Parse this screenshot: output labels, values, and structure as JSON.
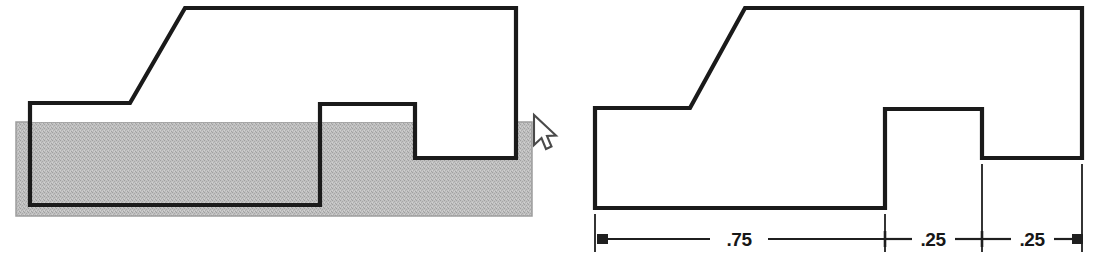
{
  "canvas": {
    "width": 1097,
    "height": 267,
    "background": "#ffffff"
  },
  "colors": {
    "outline": "#1a1a1a",
    "fill_gray": "#b9b9b9",
    "fill_gray_edge": "#9d9d9d",
    "white": "#ffffff",
    "dimension_line": "#1f1f1f",
    "cursor_fill": "#ffffff",
    "cursor_stroke": "#4a4a4a"
  },
  "figures": [
    {
      "name": "left-figure-with-stock-overlay",
      "description": "Profile outline overlaid on shaded rectangular stock bar",
      "stock_rect": {
        "x": 16,
        "y": 122,
        "width": 516,
        "height": 94
      },
      "outline_points": "30,103 184,103 184,103 30,103",
      "profile_path": "M30,103 L30,205 L320,205 L320,104 L415,104 L415,158 L516,158 L516,8 L185,8 L130,103 Z",
      "cursor": {
        "x": 533,
        "y": 115
      }
    },
    {
      "name": "right-figure-dimensioned",
      "description": "Same profile outline, unshaded, with horizontal dimension chain below",
      "profile_path": "M595,108 L595,208 L885,208 L885,109 L982,109 L982,158 L1082,158 L1082,8 L745,8 L690,108 Z"
    }
  ],
  "dimensions": {
    "line_y": 239,
    "extension_lines": [
      {
        "name": "ext-left",
        "x": 595,
        "y1": 214,
        "y2": 252
      },
      {
        "name": "ext-mid-1",
        "x": 885,
        "y1": 214,
        "y2": 252
      },
      {
        "name": "ext-mid-2",
        "x": 982,
        "y1": 164,
        "y2": 252
      },
      {
        "name": "ext-right",
        "x": 1082,
        "y1": 164,
        "y2": 252
      }
    ],
    "segments": [
      {
        "name": "dimension-segment-1",
        "label": ".75",
        "x_start": 595,
        "x_end": 885,
        "text_x": 739,
        "arrow_start": "filled",
        "arrow_end": "tick"
      },
      {
        "name": "dimension-segment-2",
        "label": ".25",
        "x_start": 885,
        "x_end": 982,
        "text_x": 933,
        "arrow_start": "tick",
        "arrow_end": "tick"
      },
      {
        "name": "dimension-segment-3",
        "label": ".25",
        "x_start": 982,
        "x_end": 1082,
        "text_x": 1032,
        "arrow_start": "tick",
        "arrow_end": "filled"
      }
    ],
    "units": "inches (decimal)"
  },
  "caption": {
    "text": ""
  }
}
